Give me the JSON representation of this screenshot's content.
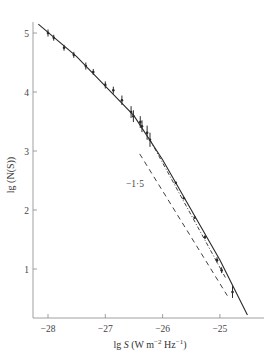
{
  "chart_data": {
    "type": "line",
    "title": "",
    "xlabel": "lg S (W m⁻² Hz⁻¹)",
    "ylabel": "lg (N(S))",
    "xlim": [
      -28.2,
      -24.3
    ],
    "ylim": [
      0,
      5.2
    ],
    "x_ticks": [
      -28,
      -27,
      -26,
      -25
    ],
    "x_tick_labels": [
      "−28",
      "−27",
      "−26",
      "−25"
    ],
    "y_ticks": [
      1,
      2,
      3,
      4,
      5
    ],
    "y_tick_labels": [
      "1",
      "2",
      "3",
      "4",
      "5"
    ],
    "grid": false,
    "legend": null,
    "annotations": [
      {
        "text": "−1·5",
        "x": -26.2,
        "y": 2.3,
        "note": "slope label for dashed reference line"
      }
    ],
    "series": [
      {
        "name": "observed counts (with error bars)",
        "style": "points-with-errorbars",
        "x": [
          -28.0,
          -27.9,
          -27.72,
          -27.55,
          -27.34,
          -27.21,
          -27.0,
          -26.86,
          -26.71,
          -26.55,
          -26.51,
          -26.39,
          -26.36,
          -26.27,
          -26.22
        ],
        "y": [
          5.0,
          4.92,
          4.75,
          4.63,
          4.44,
          4.34,
          4.12,
          4.03,
          3.86,
          3.66,
          3.59,
          3.49,
          3.42,
          3.31,
          3.19
        ],
        "yerr": [
          0.06,
          0.05,
          0.05,
          0.05,
          0.06,
          0.05,
          0.06,
          0.06,
          0.08,
          0.1,
          0.1,
          0.1,
          0.1,
          0.12,
          0.12
        ]
      },
      {
        "name": "observed counts (bright end)",
        "style": "points",
        "x": [
          -25.77,
          -25.63,
          -25.44,
          -25.26,
          -25.05,
          -24.97,
          -24.78
        ],
        "y": [
          2.46,
          2.2,
          1.87,
          1.54,
          1.15,
          0.98,
          0.61
        ],
        "yerr": [
          0,
          0,
          0,
          0.03,
          0.05,
          0.05,
          0.1
        ]
      },
      {
        "name": "model fit",
        "style": "solid",
        "x": [
          -28.17,
          -27.5,
          -27.0,
          -26.5,
          -26.0,
          -25.5,
          -25.0,
          -24.52
        ],
        "y": [
          5.15,
          4.6,
          4.1,
          3.6,
          2.85,
          2.0,
          1.15,
          0.22
        ]
      },
      {
        "name": "dotted extension",
        "style": "dash-dot",
        "x": [
          -26.22,
          -24.9
        ],
        "y": [
          3.19,
          0.85
        ]
      },
      {
        "name": "slope -1.5 reference",
        "style": "dashed",
        "x": [
          -26.4,
          -24.87
        ],
        "y": [
          2.95,
          0.55
        ]
      }
    ]
  },
  "axes": {
    "x_title_prefix": "lg ",
    "x_title_var": "S",
    "x_title_unit_open": " (W m",
    "x_title_sup1": "−2",
    "x_title_mid": " Hz",
    "x_title_sup2": "−1",
    "x_title_close": ")",
    "y_title": "lg (N(S))",
    "slope_label": "−1·5"
  },
  "colors": {
    "ink": "#2a2a2a",
    "axis": "#888888",
    "background": "#ffffff"
  }
}
